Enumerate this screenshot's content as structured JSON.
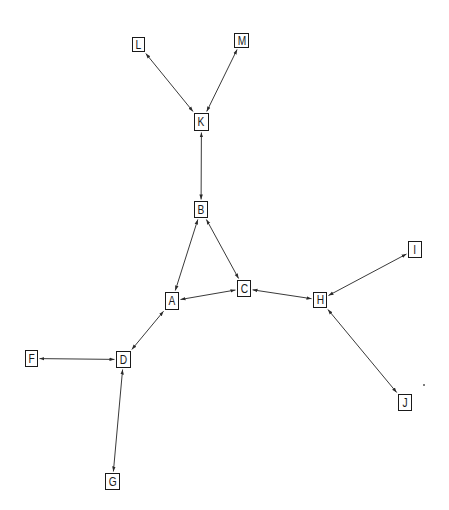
{
  "diagram": {
    "type": "undirected-network-graph",
    "edge_style": "bidirectional-arrows",
    "colors": {
      "background": "#ffffff",
      "node_border": "#1a1a1a",
      "edge": "#3a3a3a",
      "text": "#1a1a1a"
    },
    "nodes": [
      {
        "id": "L",
        "label": "L",
        "x": 132,
        "y": 37,
        "w": 13,
        "h": 15
      },
      {
        "id": "M",
        "label": "M",
        "x": 234,
        "y": 33,
        "w": 15,
        "h": 15
      },
      {
        "id": "K",
        "label": "K",
        "x": 194,
        "y": 113,
        "w": 15,
        "h": 18
      },
      {
        "id": "B",
        "label": "B",
        "x": 194,
        "y": 201,
        "w": 14,
        "h": 17
      },
      {
        "id": "A",
        "label": "A",
        "x": 165,
        "y": 292,
        "w": 14,
        "h": 18
      },
      {
        "id": "C",
        "label": "C",
        "x": 237,
        "y": 280,
        "w": 14,
        "h": 17
      },
      {
        "id": "H",
        "label": "H",
        "x": 313,
        "y": 292,
        "w": 14,
        "h": 16
      },
      {
        "id": "I",
        "label": "I",
        "x": 408,
        "y": 241,
        "w": 14,
        "h": 17
      },
      {
        "id": "J",
        "label": "J",
        "x": 398,
        "y": 394,
        "w": 14,
        "h": 17
      },
      {
        "id": "F",
        "label": "F",
        "x": 25,
        "y": 350,
        "w": 13,
        "h": 17
      },
      {
        "id": "D",
        "label": "D",
        "x": 116,
        "y": 351,
        "w": 15,
        "h": 17
      },
      {
        "id": "G",
        "label": "G",
        "x": 105,
        "y": 473,
        "w": 15,
        "h": 17
      }
    ],
    "edges": [
      {
        "from": "L",
        "to": "K"
      },
      {
        "from": "M",
        "to": "K"
      },
      {
        "from": "K",
        "to": "B"
      },
      {
        "from": "B",
        "to": "A"
      },
      {
        "from": "B",
        "to": "C"
      },
      {
        "from": "A",
        "to": "C"
      },
      {
        "from": "C",
        "to": "H"
      },
      {
        "from": "I",
        "to": "H"
      },
      {
        "from": "J",
        "to": "H"
      },
      {
        "from": "A",
        "to": "D"
      },
      {
        "from": "F",
        "to": "D"
      },
      {
        "from": "D",
        "to": "G"
      }
    ]
  }
}
